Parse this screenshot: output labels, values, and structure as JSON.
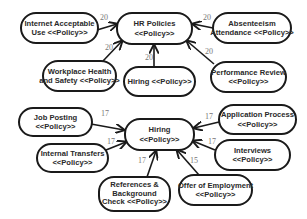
{
  "diagram": {
    "type": "dependency-graph",
    "clusters": [
      {
        "name": "hr-policies",
        "center": {
          "id": "hr_policies",
          "line1": "HR Policies",
          "line2": "<<Policy>>"
        },
        "nodes": [
          {
            "id": "internet_use",
            "line1": "Internet Acceptable",
            "line2": "Use <<Policy>>",
            "weight": "20"
          },
          {
            "id": "absenteeism",
            "line1": "Absenteeism",
            "line2": "Attendance <<Policy>>",
            "weight": "20"
          },
          {
            "id": "workplace_health",
            "line1": "Workplace Health",
            "line2": "and Safety <<Policy>>",
            "weight": "20"
          },
          {
            "id": "hiring_top",
            "line1": "Hiring <<Policy>>",
            "line2": "",
            "weight": "20"
          },
          {
            "id": "performance_review",
            "line1": "Performance Review",
            "line2": "<<Policy>>",
            "weight": "20"
          }
        ]
      },
      {
        "name": "hiring",
        "center": {
          "id": "hiring_center",
          "line1": "Hiring",
          "line2": "<<Policy>>"
        },
        "nodes": [
          {
            "id": "job_posting",
            "line1": "Job Posting",
            "line2": "<<Policy>>",
            "weight": "17"
          },
          {
            "id": "application_process",
            "line1": "Application Process",
            "line2": "<<Policy>>",
            "weight": "17"
          },
          {
            "id": "internal_transfers",
            "line1": "Internal Transfers",
            "line2": "<<Policy>>",
            "weight": "17"
          },
          {
            "id": "interviews",
            "line1": "Interviews",
            "line2": "<<Policy>>",
            "weight": "17"
          },
          {
            "id": "references",
            "line1": "References &",
            "line2": "Background",
            "line3": "Check <<Policy>>",
            "weight": "17"
          },
          {
            "id": "offer",
            "line1": "Offer of Employment",
            "line2": "<<Policy>>",
            "weight": "15"
          }
        ]
      }
    ]
  }
}
